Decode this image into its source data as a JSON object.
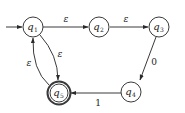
{
  "diagram": {
    "type": "finite-automaton",
    "start_state": "q1",
    "accept_states": [
      "q5"
    ],
    "states": [
      {
        "id": "q1",
        "letter": "q",
        "sub": "1",
        "cx": 33,
        "cy": 27
      },
      {
        "id": "q2",
        "letter": "q",
        "sub": "2",
        "cx": 99,
        "cy": 27
      },
      {
        "id": "q3",
        "letter": "q",
        "sub": "3",
        "cx": 159,
        "cy": 27
      },
      {
        "id": "q4",
        "letter": "q",
        "sub": "4",
        "cx": 131,
        "cy": 89
      },
      {
        "id": "q5",
        "letter": "q",
        "sub": "5",
        "cx": 58,
        "cy": 93
      }
    ],
    "transitions": [
      {
        "from": "q1",
        "to": "q2",
        "label": "ε"
      },
      {
        "from": "q2",
        "to": "q3",
        "label": "ε"
      },
      {
        "from": "q3",
        "to": "q4",
        "label": "0"
      },
      {
        "from": "q4",
        "to": "q5",
        "label": "1"
      },
      {
        "from": "q1",
        "to": "q5",
        "label": "ε"
      },
      {
        "from": "q5",
        "to": "q1",
        "label": "ε"
      }
    ],
    "colors": {
      "stroke": "#3a3a3a",
      "text": "#222222",
      "background": "#ffffff"
    }
  }
}
